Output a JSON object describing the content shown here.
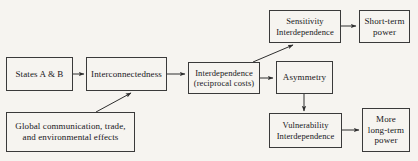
{
  "diagram": {
    "background_color": "#f6f4f0",
    "line_color": "#3a3a3a",
    "text_color": "#17171a",
    "nodes": [
      {
        "id": "states",
        "label": "States A & B",
        "x": 6,
        "y": 57,
        "w": 67,
        "h": 34,
        "font": "fs-9"
      },
      {
        "id": "interconnectedness",
        "label": "Interconnectedness",
        "x": 86,
        "y": 57,
        "w": 81,
        "h": 34,
        "font": "fs-9"
      },
      {
        "id": "global_effects",
        "label": "Global communication, trade,\nand environmental effects",
        "x": 6,
        "y": 112,
        "w": 129,
        "h": 40,
        "font": "fs-9"
      },
      {
        "id": "interdependence",
        "label": "Interdependence\n(reciprocal costs)",
        "x": 188,
        "y": 62,
        "w": 72,
        "h": 32,
        "font": "fs-85"
      },
      {
        "id": "sensitivity",
        "label": "Sensitivity\nInterdependence",
        "x": 269,
        "y": 10,
        "w": 72,
        "h": 33,
        "font": "fs-85"
      },
      {
        "id": "asymmetry",
        "label": "Asymmetry",
        "x": 276,
        "y": 61,
        "w": 57,
        "h": 33,
        "font": "fs-9"
      },
      {
        "id": "vulnerability",
        "label": "Vulnerability\nInterdependence",
        "x": 269,
        "y": 113,
        "w": 73,
        "h": 35,
        "font": "fs-85"
      },
      {
        "id": "short_term_power",
        "label": "Short-term\npower",
        "x": 359,
        "y": 10,
        "w": 51,
        "h": 33,
        "font": "fs-9"
      },
      {
        "id": "more_long_term_power",
        "label": "More\nlong-term\npower",
        "x": 362,
        "y": 108,
        "w": 48,
        "h": 44,
        "font": "fs-9"
      }
    ],
    "edges": [
      {
        "id": "states-to-interconnectedness",
        "from": "states",
        "to": "interconnectedness",
        "kind": "horizontal"
      },
      {
        "id": "global-to-interconnectedness",
        "from": "global_effects",
        "to": "interconnectedness",
        "kind": "diagonal"
      },
      {
        "id": "interconnectedness-to-interdependence",
        "from": "interconnectedness",
        "to": "interdependence",
        "kind": "horizontal"
      },
      {
        "id": "interdependence-to-sensitivity",
        "from": "interdependence",
        "to": "sensitivity",
        "kind": "diagonal"
      },
      {
        "id": "interdependence-to-asymmetry",
        "from": "interdependence",
        "to": "asymmetry",
        "kind": "horizontal"
      },
      {
        "id": "sensitivity-to-short-term-power",
        "from": "sensitivity",
        "to": "short_term_power",
        "kind": "horizontal"
      },
      {
        "id": "asymmetry-to-vulnerability",
        "from": "asymmetry",
        "to": "vulnerability",
        "kind": "vertical"
      },
      {
        "id": "vulnerability-to-more-long-term-power",
        "from": "vulnerability",
        "to": "more_long_term_power",
        "kind": "horizontal"
      }
    ]
  }
}
